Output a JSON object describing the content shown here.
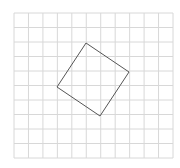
{
  "diagram": {
    "title_fragment": "'",
    "grid": {
      "x0": 14,
      "y0": 13,
      "x1": 173,
      "y1": 158,
      "cols": 11,
      "rows": 10,
      "line_color": "#d8d8d8"
    },
    "shape": {
      "type": "square",
      "vertices": [
        [
          86,
          43
        ],
        [
          129,
          72
        ],
        [
          100,
          116
        ],
        [
          57,
          87
        ]
      ],
      "stroke": "#555555"
    }
  }
}
